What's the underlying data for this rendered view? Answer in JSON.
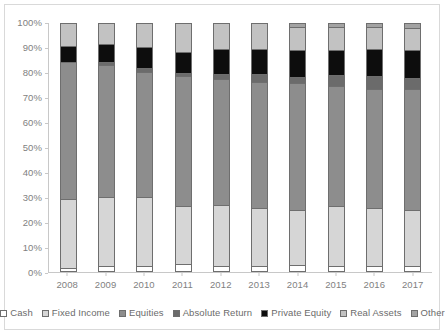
{
  "chart_data": {
    "type": "bar",
    "stacked": true,
    "stack_mode": "percent",
    "title": "",
    "subtitle": "",
    "xlabel": "",
    "ylabel": "",
    "ylim": [
      0,
      100
    ],
    "ytick_labels": [
      "0%",
      "10%",
      "20%",
      "30%",
      "40%",
      "50%",
      "60%",
      "70%",
      "80%",
      "90%",
      "100%"
    ],
    "ytick_values": [
      0,
      10,
      20,
      30,
      40,
      50,
      60,
      70,
      80,
      90,
      100
    ],
    "grid": false,
    "legend_position": "bottom",
    "categories": [
      "2008",
      "2009",
      "2010",
      "2011",
      "2012",
      "2013",
      "2014",
      "2015",
      "2016",
      "2017"
    ],
    "series": [
      {
        "name": "Cash",
        "color": "#ffffff",
        "values": [
          1.5,
          2.5,
          2.5,
          3.2,
          2.3,
          2.4,
          3.0,
          2.5,
          2.6,
          2.6
        ]
      },
      {
        "name": "Fixed Income",
        "color": "#d6d6d6",
        "values": [
          27.7,
          27.8,
          27.5,
          23.2,
          24.7,
          23.5,
          22.0,
          24.0,
          23.3,
          22.4
        ]
      },
      {
        "name": "Equities",
        "color": "#8d8d8d",
        "values": [
          55.2,
          52.9,
          50.5,
          52.4,
          50.7,
          50.6,
          50.8,
          48.4,
          47.6,
          48.5
        ]
      },
      {
        "name": "Absolute Return",
        "color": "#6b6b6b",
        "values": [
          0.0,
          1.1,
          1.3,
          1.3,
          2.0,
          2.9,
          2.5,
          4.3,
          5.2,
          4.5
        ]
      },
      {
        "name": "Private Equity",
        "color": "#0d0d0d",
        "values": [
          6.2,
          7.3,
          8.5,
          8.3,
          9.8,
          10.0,
          10.7,
          10.1,
          11.0,
          11.2
        ]
      },
      {
        "name": "Real Assets",
        "color": "#c2c2c2",
        "values": [
          9.4,
          8.4,
          9.7,
          11.6,
          10.5,
          10.6,
          9.5,
          9.2,
          8.8,
          8.8
        ]
      },
      {
        "name": "Other",
        "color": "#a3a3a3",
        "values": [
          0.0,
          0.0,
          0.0,
          0.0,
          0.0,
          0.0,
          1.5,
          1.5,
          1.5,
          2.0
        ]
      }
    ],
    "legend_entries": [
      "Cash",
      "Fixed Income",
      "Equities",
      "Absolute Return",
      "Private Equity",
      "Real Assets",
      "Other"
    ]
  },
  "colors": {
    "axis_text": "#7f7f7f",
    "axis_line": "#c8c8c8",
    "border": "#d9d9d9",
    "bar_outline": "#6e6e6e",
    "legend_text": "#6b6b6b",
    "background": "#ffffff"
  }
}
